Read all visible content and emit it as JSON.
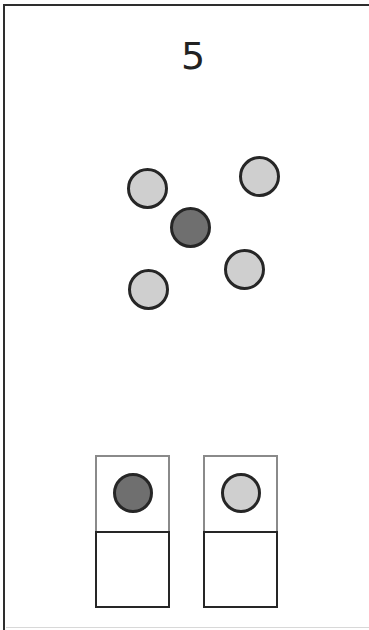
{
  "counter": {
    "value": "5"
  },
  "colors": {
    "light_dot": "#cfcfcf",
    "dark_dot": "#6f6f6f",
    "outline": "#262626",
    "frame": "#2e2e2e",
    "slot_top_border": "#8a8a8a"
  },
  "field": {
    "dots": [
      {
        "id": "dot-1",
        "shade": "light",
        "cx": 147,
        "cy": 188
      },
      {
        "id": "dot-2",
        "shade": "light",
        "cx": 259,
        "cy": 176
      },
      {
        "id": "dot-3",
        "shade": "dark",
        "cx": 190,
        "cy": 227
      },
      {
        "id": "dot-4",
        "shade": "light",
        "cx": 244,
        "cy": 269
      },
      {
        "id": "dot-5",
        "shade": "light",
        "cx": 148,
        "cy": 289
      }
    ]
  },
  "choices": [
    {
      "id": "choice-dark",
      "shade": "dark",
      "left": 95,
      "top": 455
    },
    {
      "id": "choice-light",
      "shade": "light",
      "left": 203,
      "top": 455
    }
  ]
}
